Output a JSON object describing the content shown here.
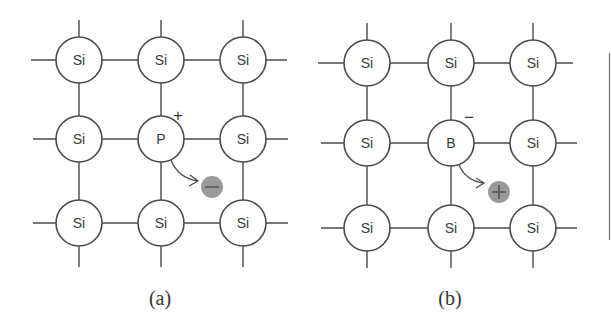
{
  "figure": {
    "colors": {
      "line": "#4a4a4a",
      "carrier_fill": "#9a9a9a",
      "background": "#ffffff"
    },
    "atom_radius": 23,
    "panels": [
      {
        "id": "a",
        "label": "(a)",
        "dopant": "P",
        "dopant_charge": "+",
        "carrier_type": "electron",
        "carrier_sign": "−",
        "columns_x": [
          79,
          161,
          243
        ],
        "rows_y": [
          60,
          139,
          223
        ],
        "grid": [
          [
            "Si",
            "Si",
            "Si"
          ],
          [
            "Si",
            "P",
            "Si"
          ],
          [
            "Si",
            "Si",
            "Si"
          ]
        ],
        "carrier_pos": [
          212,
          187
        ],
        "charge_pos": [
          178,
          115
        ],
        "label_pos": [
          160,
          298
        ]
      },
      {
        "id": "b",
        "label": "(b)",
        "dopant": "B",
        "dopant_charge": "−",
        "carrier_type": "hole",
        "carrier_sign": "+",
        "columns_x": [
          367,
          451,
          533
        ],
        "rows_y": [
          63,
          143,
          228
        ],
        "grid": [
          [
            "Si",
            "Si",
            "Si"
          ],
          [
            "Si",
            "B",
            "Si"
          ],
          [
            "Si",
            "Si",
            "Si"
          ]
        ],
        "carrier_pos": [
          499,
          192
        ],
        "charge_pos": [
          469,
          118
        ],
        "label_pos": [
          450,
          298
        ]
      }
    ]
  }
}
